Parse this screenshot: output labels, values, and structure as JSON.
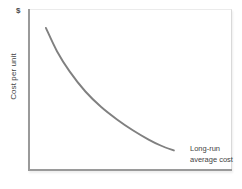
{
  "figure": {
    "width": 242,
    "height": 189,
    "background": "#ffffff"
  },
  "axes": {
    "y_unit_label": "$",
    "y_title": "Cost per unit",
    "x_title": "",
    "axis_color": "#9a9a9a",
    "frame_color": "#d9d9d9"
  },
  "annotation": {
    "line1": "Long-run",
    "line2": "average cost"
  },
  "chart_data": {
    "type": "line",
    "title": "",
    "subtitle": "",
    "xlabel": "",
    "ylabel": "Cost per unit",
    "y_unit": "$",
    "grid": false,
    "legend_position": "inline-annotation-right",
    "series": [
      {
        "name": "Long-run average cost",
        "color": "#808080",
        "x": [
          0.05,
          0.12,
          0.2,
          0.3,
          0.4,
          0.5,
          0.6,
          0.7,
          0.78,
          0.86
        ],
        "y": [
          0.91,
          0.76,
          0.63,
          0.5,
          0.4,
          0.32,
          0.25,
          0.19,
          0.15,
          0.12
        ]
      }
    ],
    "xlim": [
      0,
      1
    ],
    "ylim": [
      0,
      1
    ],
    "x_tick_labels": [],
    "y_tick_labels": [],
    "annotations": [
      {
        "text": "Long-run average cost",
        "x": 0.9,
        "y": 0.14
      }
    ]
  }
}
